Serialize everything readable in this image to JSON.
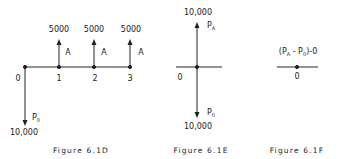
{
  "figures": [
    {
      "id": "6.1D",
      "caption": "Figure 6.1D",
      "periods": [
        "0",
        "1",
        "2",
        "3"
      ],
      "inflows": [
        {
          "period": "1",
          "amount": "5000",
          "label": "A"
        },
        {
          "period": "2",
          "amount": "5000",
          "label": "A"
        },
        {
          "period": "3",
          "amount": "5000",
          "label": "A"
        }
      ],
      "outflow": {
        "period": "0",
        "amount": "10,000",
        "label": "P",
        "label_sub": "0"
      }
    },
    {
      "id": "6.1E",
      "caption": "Figure 6.1E",
      "origin": "0",
      "inflow": {
        "amount": "10,000",
        "label": "P",
        "label_sub": "A"
      },
      "outflow": {
        "amount": "10,000",
        "label": "P",
        "label_sub": "0"
      }
    },
    {
      "id": "6.1F",
      "caption": "Figure 6.1F",
      "origin": "0",
      "equation": {
        "open": "(P",
        "sub1": "A",
        "mid": " - P",
        "sub2": "0",
        "close": ")-0"
      }
    }
  ]
}
